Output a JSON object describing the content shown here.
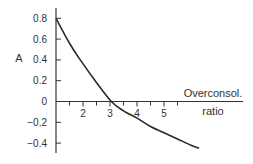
{
  "chart_data": {
    "type": "line",
    "title": "",
    "xlabel": "Overconsol. ratio",
    "xlabel_lines": [
      "Overconsol.",
      "ratio"
    ],
    "ylabel": "A",
    "xlim": [
      1,
      6.5
    ],
    "ylim": [
      -0.5,
      0.85
    ],
    "x_ticks": [
      2,
      3,
      4,
      5
    ],
    "x_tick_labels": [
      "2",
      "3",
      "4",
      "5"
    ],
    "x_minor_tick_step": 0.5,
    "y_ticks": [
      0.8,
      0.6,
      0.4,
      0.2,
      0,
      -0.2,
      -0.4
    ],
    "y_tick_labels": [
      "0.8",
      "0.6",
      "0.4",
      "0.2",
      "0",
      "−0.2",
      "−0.4"
    ],
    "grid": false,
    "legend": null,
    "series": [
      {
        "name": "A vs overconsolidation ratio",
        "color": "#2a2a2a",
        "x": [
          1.0,
          1.5,
          1.9,
          2.45,
          3.05,
          3.5,
          4.0,
          4.5,
          5.0,
          5.5,
          6.0,
          6.3
        ],
        "y": [
          0.8,
          0.56,
          0.4,
          0.2,
          0.0,
          -0.09,
          -0.16,
          -0.24,
          -0.3,
          -0.36,
          -0.42,
          -0.45
        ]
      }
    ]
  },
  "labels": {
    "ylabel": "A",
    "xlabel_line1": "Overconsol.",
    "xlabel_line2": "ratio"
  },
  "colors": {
    "axis": "#333333",
    "curve": "#2a2a2a",
    "text": "#333333"
  }
}
